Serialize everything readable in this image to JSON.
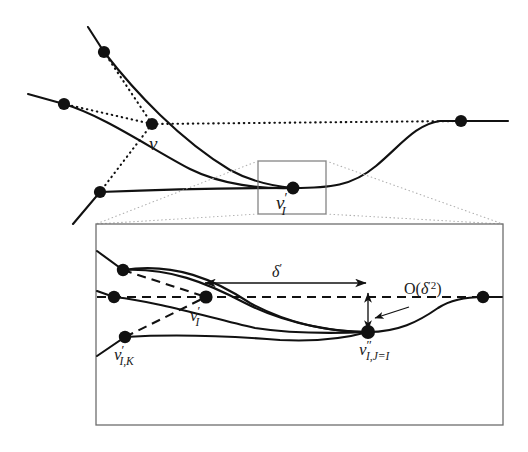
{
  "figure": {
    "background_color": "#ffffff",
    "stroke_color": "#111111",
    "guide_color": "#9a9a9a",
    "box_color": "#6e6e6e",
    "labels": {
      "v": "v",
      "v_I_prime_upper": "v",
      "v_I_prime_upper_prime": "′",
      "v_I_prime_upper_sub": "I",
      "v_I_prime_detail": "v",
      "v_I_prime_detail_prime": "′",
      "v_I_prime_detail_sub": "I",
      "v_IK_prime": "v",
      "v_IK_prime_prime": "′",
      "v_IK_prime_sub": "I,K",
      "v_IJ_dprime": "v",
      "v_IJ_dprime_prime": "″",
      "v_IJ_dprime_sub": "I,J=I",
      "delta_prime": "δ",
      "delta_prime_mark": "′",
      "order_open": "O(",
      "order_delta": "δ",
      "order_prime2": "′2",
      "order_close": ")"
    },
    "annotations": [
      {
        "name": "delta-prime-measure",
        "text": "δ′",
        "kind": "double-arrow-horizontal"
      },
      {
        "name": "order-delta-squared",
        "text": "O(δ′2)",
        "kind": "leader-arrow"
      },
      {
        "name": "offset-measure",
        "text": "",
        "kind": "double-arrow-vertical"
      }
    ],
    "upper_panel": {
      "name": "coarse-mesh-panel",
      "zoom_box": {
        "x": 258,
        "y": 161,
        "width": 68,
        "height": 53
      },
      "nodes": [
        {
          "name": "node-upper-left-top",
          "x": 104,
          "y": 52
        },
        {
          "name": "node-upper-left-mid",
          "x": 64,
          "y": 104
        },
        {
          "name": "node-v",
          "x": 152,
          "y": 124
        },
        {
          "name": "node-lower-left",
          "x": 100,
          "y": 192
        },
        {
          "name": "node-v-i-prime",
          "x": 293,
          "y": 188
        },
        {
          "name": "node-right",
          "x": 461,
          "y": 121
        }
      ]
    },
    "detail_panel": {
      "name": "magnified-detail-panel",
      "frame": {
        "x": 96,
        "y": 224,
        "width": 407,
        "height": 201
      },
      "nodes": [
        {
          "name": "node-detail-upper",
          "x": 123,
          "y": 270
        },
        {
          "name": "node-detail-left",
          "x": 114,
          "y": 297
        },
        {
          "name": "node-detail-vik",
          "x": 125,
          "y": 337
        },
        {
          "name": "node-detail-vi-prime",
          "x": 206,
          "y": 297
        },
        {
          "name": "node-detail-vij-dprime",
          "x": 368,
          "y": 332
        },
        {
          "name": "node-detail-right",
          "x": 483,
          "y": 297
        }
      ],
      "delta_arrow": {
        "x1": 205,
        "x2": 366,
        "y": 283
      },
      "offset_arrow": {
        "x": 368,
        "y1": 293,
        "y2": 330
      }
    }
  }
}
